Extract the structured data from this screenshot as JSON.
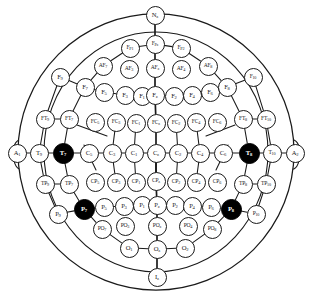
{
  "figure": {
    "type": "head-map-diagram",
    "colors": {
      "outline": "#1a1a1a",
      "electrode_fill": "#ffffff",
      "highlight_fill": "#000000",
      "highlight_text": "#ffffff",
      "background": "#ffffff"
    },
    "view": "top-down, nose at top (Nz), inion at bottom (Iz)",
    "highlighted_electrodes": [
      "T7",
      "T8",
      "P7",
      "P8"
    ]
  },
  "landmarks": {
    "nasion": "Nz",
    "inion": "Iz",
    "left_ear": "A1",
    "right_ear": "A2"
  },
  "electrodes": [
    {
      "name": "Nz",
      "base": "N",
      "sub": "z",
      "x": 155,
      "y": 15,
      "r": 9.5,
      "hl": false,
      "size": "big"
    },
    {
      "name": "Fp1",
      "base": "F",
      "sub": "P1",
      "x": 130,
      "y": 48,
      "r": 9.5,
      "hl": false,
      "size": "small"
    },
    {
      "name": "Fpz",
      "base": "F",
      "sub": "Pz",
      "x": 155,
      "y": 44,
      "r": 9.5,
      "hl": false,
      "size": "small"
    },
    {
      "name": "Fp2",
      "base": "F",
      "sub": "P2",
      "x": 181,
      "y": 48,
      "r": 9.5,
      "hl": false,
      "size": "small"
    },
    {
      "name": "AF7",
      "base": "AF",
      "sub": "7",
      "x": 103,
      "y": 66,
      "r": 9.5,
      "hl": false,
      "size": "small"
    },
    {
      "name": "AF3",
      "base": "AF",
      "sub": "3",
      "x": 129,
      "y": 69,
      "r": 9.5,
      "hl": false,
      "size": "small"
    },
    {
      "name": "AFz",
      "base": "AF",
      "sub": "z",
      "x": 155,
      "y": 68,
      "r": 9.5,
      "hl": false,
      "size": "small"
    },
    {
      "name": "AF4",
      "base": "AF",
      "sub": "4",
      "x": 181,
      "y": 69,
      "r": 9.5,
      "hl": false,
      "size": "small"
    },
    {
      "name": "AF8",
      "base": "AF",
      "sub": "8",
      "x": 208,
      "y": 66,
      "r": 9.5,
      "hl": false,
      "size": "small"
    },
    {
      "name": "F9",
      "base": "F",
      "sub": "9",
      "x": 60,
      "y": 77,
      "r": 9.5,
      "hl": false,
      "size": "big"
    },
    {
      "name": "F7",
      "base": "F",
      "sub": "7",
      "x": 85,
      "y": 87,
      "r": 9.5,
      "hl": false,
      "size": "big"
    },
    {
      "name": "F5",
      "base": "F",
      "sub": "5",
      "x": 104,
      "y": 92,
      "r": 9.5,
      "hl": false,
      "size": "big"
    },
    {
      "name": "F3",
      "base": "F",
      "sub": "3",
      "x": 125,
      "y": 95,
      "r": 9.5,
      "hl": false,
      "size": "big"
    },
    {
      "name": "F1",
      "base": "F",
      "sub": "1",
      "x": 142,
      "y": 96,
      "r": 9.5,
      "hl": false,
      "size": "big"
    },
    {
      "name": "Fz",
      "base": "F",
      "sub": "z",
      "x": 155,
      "y": 95,
      "r": 9.5,
      "hl": false,
      "size": "big"
    },
    {
      "name": "F2",
      "base": "F",
      "sub": "2",
      "x": 174,
      "y": 96,
      "r": 9.5,
      "hl": false,
      "size": "big"
    },
    {
      "name": "F4",
      "base": "F",
      "sub": "4",
      "x": 192,
      "y": 95,
      "r": 9.5,
      "hl": false,
      "size": "big"
    },
    {
      "name": "F6",
      "base": "F",
      "sub": "6",
      "x": 210,
      "y": 92,
      "r": 9.5,
      "hl": false,
      "size": "big"
    },
    {
      "name": "F8",
      "base": "F",
      "sub": "8",
      "x": 227,
      "y": 87,
      "r": 9.5,
      "hl": false,
      "size": "big"
    },
    {
      "name": "F10",
      "base": "F",
      "sub": "10",
      "x": 253,
      "y": 77,
      "r": 9.5,
      "hl": false,
      "size": "small"
    },
    {
      "name": "FT9",
      "base": "FT",
      "sub": "9",
      "x": 45,
      "y": 119,
      "r": 9.5,
      "hl": false,
      "size": "small"
    },
    {
      "name": "FT7",
      "base": "FT",
      "sub": "7",
      "x": 69,
      "y": 119,
      "r": 9.5,
      "hl": false,
      "size": "small"
    },
    {
      "name": "FC5",
      "base": "FC",
      "sub": "5",
      "x": 95,
      "y": 122,
      "r": 9.5,
      "hl": false,
      "size": "small"
    },
    {
      "name": "FC3",
      "base": "FC",
      "sub": "3",
      "x": 116,
      "y": 122,
      "r": 9.5,
      "hl": false,
      "size": "small"
    },
    {
      "name": "FC1",
      "base": "FC",
      "sub": "1",
      "x": 136,
      "y": 123,
      "r": 9.5,
      "hl": false,
      "size": "small"
    },
    {
      "name": "FCz",
      "base": "FC",
      "sub": "z",
      "x": 156,
      "y": 123,
      "r": 9.5,
      "hl": false,
      "size": "small"
    },
    {
      "name": "FC2",
      "base": "FC",
      "sub": "2",
      "x": 176,
      "y": 123,
      "r": 9.5,
      "hl": false,
      "size": "small"
    },
    {
      "name": "FC4",
      "base": "FC",
      "sub": "4",
      "x": 196,
      "y": 122,
      "r": 9.5,
      "hl": false,
      "size": "small"
    },
    {
      "name": "FC6",
      "base": "FC",
      "sub": "6",
      "x": 217,
      "y": 122,
      "r": 9.5,
      "hl": false,
      "size": "small"
    },
    {
      "name": "FT8",
      "base": "FT",
      "sub": "8",
      "x": 243,
      "y": 119,
      "r": 9.5,
      "hl": false,
      "size": "small"
    },
    {
      "name": "FT10",
      "base": "FT",
      "sub": "10",
      "x": 266,
      "y": 119,
      "r": 9.5,
      "hl": false,
      "size": "small"
    },
    {
      "name": "A1",
      "base": "A",
      "sub": "1",
      "x": 17,
      "y": 153,
      "r": 9.5,
      "hl": false,
      "size": "big"
    },
    {
      "name": "T9",
      "base": "T",
      "sub": "9",
      "x": 39,
      "y": 153,
      "r": 9.5,
      "hl": false,
      "size": "big"
    },
    {
      "name": "T7",
      "base": "T",
      "sub": "7",
      "x": 63,
      "y": 153,
      "r": 10.5,
      "hl": true,
      "size": "big"
    },
    {
      "name": "C5",
      "base": "C",
      "sub": "5",
      "x": 89,
      "y": 153,
      "r": 9.5,
      "hl": false,
      "size": "big"
    },
    {
      "name": "C3",
      "base": "C",
      "sub": "3",
      "x": 112,
      "y": 153,
      "r": 9.5,
      "hl": false,
      "size": "big"
    },
    {
      "name": "C1",
      "base": "C",
      "sub": "1",
      "x": 134,
      "y": 153,
      "r": 9.5,
      "hl": false,
      "size": "big"
    },
    {
      "name": "Cz",
      "base": "C",
      "sub": "z",
      "x": 156,
      "y": 153,
      "r": 9.5,
      "hl": false,
      "size": "big"
    },
    {
      "name": "C2",
      "base": "C",
      "sub": "2",
      "x": 178,
      "y": 153,
      "r": 9.5,
      "hl": false,
      "size": "big"
    },
    {
      "name": "C4",
      "base": "C",
      "sub": "4",
      "x": 200,
      "y": 153,
      "r": 9.5,
      "hl": false,
      "size": "big"
    },
    {
      "name": "C6",
      "base": "C",
      "sub": "6",
      "x": 223,
      "y": 153,
      "r": 9.5,
      "hl": false,
      "size": "big"
    },
    {
      "name": "T8",
      "base": "T",
      "sub": "8",
      "x": 249,
      "y": 153,
      "r": 10.5,
      "hl": true,
      "size": "big"
    },
    {
      "name": "T10",
      "base": "T",
      "sub": "10",
      "x": 272,
      "y": 153,
      "r": 9.5,
      "hl": false,
      "size": "small"
    },
    {
      "name": "A2",
      "base": "A",
      "sub": "2",
      "x": 295,
      "y": 153,
      "r": 9.5,
      "hl": false,
      "size": "big"
    },
    {
      "name": "TP9",
      "base": "TP",
      "sub": "9",
      "x": 45,
      "y": 184,
      "r": 9.5,
      "hl": false,
      "size": "small"
    },
    {
      "name": "TP7",
      "base": "TP",
      "sub": "7",
      "x": 69,
      "y": 184,
      "r": 9.5,
      "hl": false,
      "size": "small"
    },
    {
      "name": "CP5",
      "base": "CP",
      "sub": "5",
      "x": 95,
      "y": 182,
      "r": 9.5,
      "hl": false,
      "size": "small"
    },
    {
      "name": "CP3",
      "base": "CP",
      "sub": "3",
      "x": 116,
      "y": 182,
      "r": 9.5,
      "hl": false,
      "size": "small"
    },
    {
      "name": "CP1",
      "base": "CP",
      "sub": "1",
      "x": 136,
      "y": 182,
      "r": 9.5,
      "hl": false,
      "size": "small"
    },
    {
      "name": "CPz",
      "base": "CP",
      "sub": "z",
      "x": 156,
      "y": 181,
      "r": 9.5,
      "hl": false,
      "size": "small"
    },
    {
      "name": "CP2",
      "base": "CP",
      "sub": "2",
      "x": 176,
      "y": 182,
      "r": 9.5,
      "hl": false,
      "size": "small"
    },
    {
      "name": "CP4",
      "base": "CP",
      "sub": "4",
      "x": 196,
      "y": 182,
      "r": 9.5,
      "hl": false,
      "size": "small"
    },
    {
      "name": "CP6",
      "base": "CP",
      "sub": "6",
      "x": 217,
      "y": 182,
      "r": 9.5,
      "hl": false,
      "size": "small"
    },
    {
      "name": "TP8",
      "base": "TP",
      "sub": "8",
      "x": 243,
      "y": 184,
      "r": 9.5,
      "hl": false,
      "size": "small"
    },
    {
      "name": "TP10",
      "base": "TP",
      "sub": "10",
      "x": 266,
      "y": 184,
      "r": 9.5,
      "hl": false,
      "size": "small"
    },
    {
      "name": "P9",
      "base": "P",
      "sub": "9",
      "x": 58,
      "y": 214,
      "r": 9.5,
      "hl": false,
      "size": "big"
    },
    {
      "name": "P7",
      "base": "P",
      "sub": "7",
      "x": 84,
      "y": 209,
      "r": 10.5,
      "hl": true,
      "size": "big"
    },
    {
      "name": "P5",
      "base": "P",
      "sub": "5",
      "x": 104,
      "y": 207,
      "r": 9.5,
      "hl": false,
      "size": "big"
    },
    {
      "name": "P3",
      "base": "P",
      "sub": "3",
      "x": 124,
      "y": 206,
      "r": 9.5,
      "hl": false,
      "size": "big"
    },
    {
      "name": "P1",
      "base": "P",
      "sub": "1",
      "x": 142,
      "y": 205,
      "r": 9.5,
      "hl": false,
      "size": "big"
    },
    {
      "name": "Pz",
      "base": "P",
      "sub": "z",
      "x": 157,
      "y": 205,
      "r": 9.5,
      "hl": false,
      "size": "big"
    },
    {
      "name": "P2",
      "base": "P",
      "sub": "2",
      "x": 175,
      "y": 205,
      "r": 9.5,
      "hl": false,
      "size": "big"
    },
    {
      "name": "P4",
      "base": "P",
      "sub": "4",
      "x": 192,
      "y": 206,
      "r": 9.5,
      "hl": false,
      "size": "big"
    },
    {
      "name": "P6",
      "base": "P",
      "sub": "6",
      "x": 211,
      "y": 207,
      "r": 9.5,
      "hl": false,
      "size": "big"
    },
    {
      "name": "P8",
      "base": "P",
      "sub": "8",
      "x": 231,
      "y": 209,
      "r": 10.5,
      "hl": true,
      "size": "big"
    },
    {
      "name": "P10",
      "base": "P",
      "sub": "10",
      "x": 256,
      "y": 214,
      "r": 9.5,
      "hl": false,
      "size": "small"
    },
    {
      "name": "PO7",
      "base": "PO",
      "sub": "7",
      "x": 102,
      "y": 229,
      "r": 9.5,
      "hl": false,
      "size": "small"
    },
    {
      "name": "PO3",
      "base": "PO",
      "sub": "3",
      "x": 125,
      "y": 226,
      "r": 9.5,
      "hl": false,
      "size": "small"
    },
    {
      "name": "POz",
      "base": "PO",
      "sub": "z",
      "x": 157,
      "y": 226,
      "r": 9.5,
      "hl": false,
      "size": "small"
    },
    {
      "name": "PO4",
      "base": "PO",
      "sub": "4",
      "x": 188,
      "y": 226,
      "r": 9.5,
      "hl": false,
      "size": "small"
    },
    {
      "name": "PO8",
      "base": "PO",
      "sub": "8",
      "x": 212,
      "y": 229,
      "r": 9.5,
      "hl": false,
      "size": "small"
    },
    {
      "name": "O1",
      "base": "O",
      "sub": "1",
      "x": 129,
      "y": 248,
      "r": 9.5,
      "hl": false,
      "size": "big"
    },
    {
      "name": "Oz",
      "base": "O",
      "sub": "z",
      "x": 157,
      "y": 249,
      "r": 9.5,
      "hl": false,
      "size": "big"
    },
    {
      "name": "O2",
      "base": "O",
      "sub": "2",
      "x": 185,
      "y": 248,
      "r": 9.5,
      "hl": false,
      "size": "big"
    },
    {
      "name": "Iz",
      "base": "I",
      "sub": "z",
      "x": 157,
      "y": 277,
      "r": 9.5,
      "hl": false,
      "size": "big"
    }
  ],
  "connections": [
    [
      "Nz",
      "Fpz"
    ],
    [
      "Fp1",
      "Fpz"
    ],
    [
      "Fpz",
      "Fp2"
    ],
    [
      "Fp1",
      "AF7"
    ],
    [
      "Fp2",
      "AF8"
    ],
    [
      "Fpz",
      "AFz"
    ],
    [
      "AFz",
      "Fz"
    ],
    [
      "AF7",
      "F7"
    ],
    [
      "AF8",
      "F8"
    ],
    [
      "F9",
      "F7"
    ],
    [
      "F7",
      "F5"
    ],
    [
      "F5",
      "F3"
    ],
    [
      "F3",
      "F1"
    ],
    [
      "F1",
      "Fz"
    ],
    [
      "Fz",
      "F2"
    ],
    [
      "F2",
      "F4"
    ],
    [
      "F4",
      "F6"
    ],
    [
      "F6",
      "F8"
    ],
    [
      "F8",
      "F10"
    ],
    [
      "F9",
      "FT9"
    ],
    [
      "F10",
      "FT10"
    ],
    [
      "F7",
      "FT7"
    ],
    [
      "F8",
      "FT8"
    ],
    [
      "FT9",
      "FT7"
    ],
    [
      "FT8",
      "FT10"
    ],
    [
      "Fz",
      "FCz"
    ],
    [
      "FCz",
      "Cz"
    ],
    [
      "FT7",
      "T7"
    ],
    [
      "FT8",
      "T8"
    ],
    [
      "FT9",
      "T9"
    ],
    [
      "FT10",
      "T10"
    ],
    [
      "A1",
      "T9"
    ],
    [
      "T9",
      "T7"
    ],
    [
      "T7",
      "C5"
    ],
    [
      "C5",
      "C3"
    ],
    [
      "C3",
      "C1"
    ],
    [
      "C1",
      "Cz"
    ],
    [
      "Cz",
      "C2"
    ],
    [
      "C2",
      "C4"
    ],
    [
      "C4",
      "C6"
    ],
    [
      "C6",
      "T8"
    ],
    [
      "T8",
      "T10"
    ],
    [
      "T10",
      "A2"
    ],
    [
      "T7",
      "TP7"
    ],
    [
      "T8",
      "TP8"
    ],
    [
      "T9",
      "TP9"
    ],
    [
      "T10",
      "TP10"
    ],
    [
      "Cz",
      "CPz"
    ],
    [
      "CPz",
      "Pz"
    ],
    [
      "TP9",
      "TP7"
    ],
    [
      "TP8",
      "TP10"
    ],
    [
      "TP7",
      "P7"
    ],
    [
      "TP8",
      "P8"
    ],
    [
      "TP9",
      "P9"
    ],
    [
      "TP10",
      "P10"
    ],
    [
      "P9",
      "P7"
    ],
    [
      "P7",
      "P5"
    ],
    [
      "P5",
      "P3"
    ],
    [
      "P3",
      "P1"
    ],
    [
      "P1",
      "Pz"
    ],
    [
      "Pz",
      "P2"
    ],
    [
      "P2",
      "P4"
    ],
    [
      "P4",
      "P6"
    ],
    [
      "P6",
      "P8"
    ],
    [
      "P8",
      "P10"
    ],
    [
      "P7",
      "PO7"
    ],
    [
      "P8",
      "PO8"
    ],
    [
      "Pz",
      "POz"
    ],
    [
      "POz",
      "Oz"
    ],
    [
      "PO7",
      "O1"
    ],
    [
      "PO8",
      "O2"
    ],
    [
      "O1",
      "Oz"
    ],
    [
      "Oz",
      "O2"
    ],
    [
      "Oz",
      "Iz"
    ],
    [
      "C3",
      "CP3"
    ],
    [
      "C1",
      "CP1"
    ],
    [
      "Cz",
      "CPz"
    ],
    [
      "C2",
      "CP2"
    ],
    [
      "C4",
      "CP4"
    ],
    [
      "C3",
      "FC3"
    ],
    [
      "C1",
      "FC1"
    ],
    [
      "C2",
      "FC2"
    ],
    [
      "C4",
      "FC4"
    ]
  ]
}
